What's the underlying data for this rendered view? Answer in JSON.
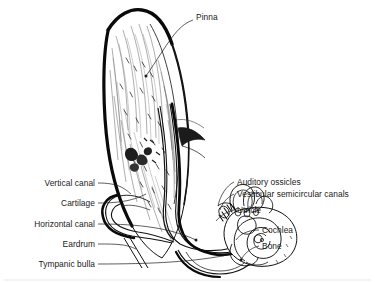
{
  "figure": {
    "background_color": "#ffffff",
    "ink_color": "#111111",
    "text_color": "#1a1a1a"
  },
  "labels_top": [
    {
      "id": "pinna",
      "text": "Pinna",
      "align": "left",
      "x": 196,
      "y": 17
    }
  ],
  "labels_left": [
    {
      "id": "vertical-canal",
      "text": "Vertical canal",
      "x": 95,
      "y": 186
    },
    {
      "id": "cartilage",
      "text": "Cartilage",
      "x": 95,
      "y": 206
    },
    {
      "id": "horizontal-canal",
      "text": "Horizontal canal",
      "x": 95,
      "y": 227
    },
    {
      "id": "eardrum",
      "text": "Eardrum",
      "x": 95,
      "y": 247
    },
    {
      "id": "tympanic-bulla",
      "text": "Tympanic bulla",
      "x": 95,
      "y": 267
    }
  ],
  "labels_right": [
    {
      "id": "auditory-ossicles",
      "text": "Auditory ossicles",
      "x": 237,
      "y": 185
    },
    {
      "id": "vestibular-semicircular-canals",
      "text": "Vestibular semicircular canals",
      "x": 237,
      "y": 197
    },
    {
      "id": "utricle",
      "text": "Utricle",
      "x": 237,
      "y": 213
    },
    {
      "id": "cochlea",
      "text": "Cochlea",
      "x": 262,
      "y": 233
    },
    {
      "id": "bone",
      "text": "Bone",
      "x": 262,
      "y": 249
    }
  ],
  "anatomy_parts": [
    "pinna",
    "vertical canal",
    "cartilage",
    "horizontal canal",
    "eardrum",
    "tympanic bulla",
    "auditory ossicles",
    "vestibular semicircular canals",
    "utricle",
    "cochlea",
    "bone"
  ]
}
